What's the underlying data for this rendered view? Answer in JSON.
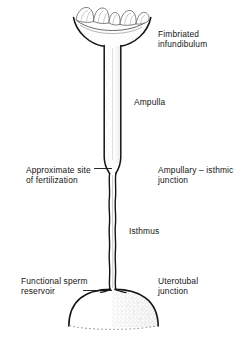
{
  "figure": {
    "name": "mammalian-oviduct-diagram",
    "background_color": "#ffffff",
    "ink_color": "#141414",
    "stipple_color": "#9a9a9a"
  },
  "labels": {
    "fimbriated_infundibulum": "Fimbriated\ninfundibulum",
    "ampulla": "Ampulla",
    "approximate_site_of_fertilization": "Approximate site\nof fertilization",
    "ampullary_isthmic_junction": "Ampullary – isthmic\njunction",
    "isthmus": "Isthmus",
    "functional_sperm_reservoir": "Functional sperm\nreservoir",
    "uterotubal_junction": "Uterotubal\njunction"
  },
  "structures": [
    {
      "name": "fimbriated-infundibulum",
      "description": "funnel-shaped cup with wavy fimbriae at top of tube"
    },
    {
      "name": "ampulla",
      "description": "wide straight tube segment below the infundibulum"
    },
    {
      "name": "ampullary-isthmic-junction",
      "description": "narrowing transition between ampulla and isthmus"
    },
    {
      "name": "isthmus",
      "description": "long narrow wavy tube segment"
    },
    {
      "name": "uterotubal-junction",
      "description": "entry of the isthmus into the uterine horn"
    },
    {
      "name": "uterine-horn",
      "description": "dome-shaped organ at base with dotted baseline"
    }
  ],
  "leader_lines": [
    {
      "name": "leader-approximate-site",
      "from_label": "approximate_site_of_fertilization",
      "to_structure": "ampullary-isthmic-junction"
    },
    {
      "name": "leader-functional-sperm",
      "from_label": "functional_sperm_reservoir",
      "to_structure": "uterotubal-junction"
    }
  ]
}
